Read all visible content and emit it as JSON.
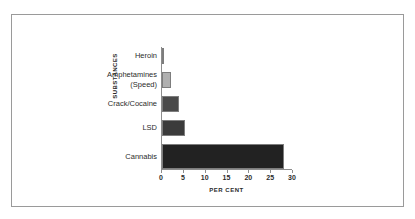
{
  "chart_data": {
    "type": "bar",
    "orientation": "horizontal",
    "title": "",
    "xlabel": "PER CENT",
    "ylabel": "SUBSTANCES",
    "categories": [
      "Heroin",
      "Amphetamines (Speed)",
      "Crack/Cocaine",
      "LSD",
      "Cannabis"
    ],
    "category_labels": [
      {
        "line1": "Heroin",
        "line2": ""
      },
      {
        "line1": "Amphetamines",
        "line2": "(Speed)"
      },
      {
        "line1": "Crack/Cocaine",
        "line2": ""
      },
      {
        "line1": "LSD",
        "line2": ""
      },
      {
        "line1": "Cannabis",
        "line2": ""
      }
    ],
    "values": [
      0.5,
      2,
      4,
      5.3,
      28
    ],
    "bar_colors": [
      "#c9c9c9",
      "#b0b0b0",
      "#4a4a4a",
      "#3b3b3b",
      "#222222"
    ],
    "xlim": [
      0,
      30
    ],
    "xticks": [
      0,
      5,
      10,
      15,
      20,
      25,
      30
    ],
    "xtick_labels": [
      "0",
      "5",
      "10",
      "15",
      "20",
      "25",
      "30"
    ],
    "grid": false,
    "legend": "none"
  },
  "figure": {
    "frame_color": "#9a9a9a",
    "axis_color": "#8d8d8d",
    "background": "#ffffff"
  }
}
